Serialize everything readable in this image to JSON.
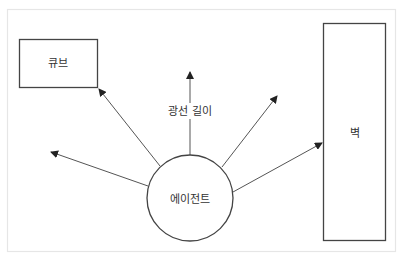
{
  "diagram": {
    "title": "",
    "colors": {
      "frame": "#e6e6e6",
      "shape_stroke": "#444444",
      "ray_stroke": "#555555",
      "text": "#333333",
      "background": "#ffffff"
    },
    "nodes": {
      "agent": {
        "label": "에이전트",
        "shape": "circle"
      },
      "cube": {
        "label": "큐브",
        "shape": "rectangle"
      },
      "wall": {
        "label": "벽",
        "shape": "rectangle"
      }
    },
    "rays": {
      "ray_length_label": "광선 길이",
      "items": [
        {
          "id": "ray-to-cube",
          "target": "cube"
        },
        {
          "id": "ray-left",
          "target": ""
        },
        {
          "id": "ray-up",
          "target": "",
          "label": "광선 길이"
        },
        {
          "id": "ray-upper-right",
          "target": ""
        },
        {
          "id": "ray-to-wall",
          "target": "wall"
        }
      ]
    }
  }
}
